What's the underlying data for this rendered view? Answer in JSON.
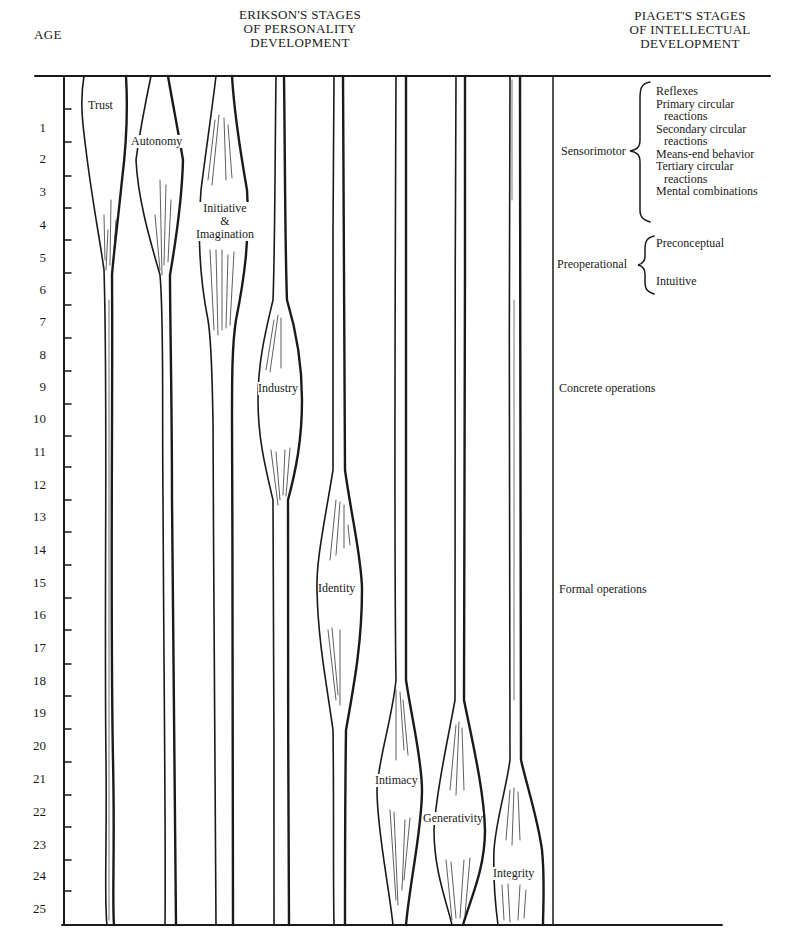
{
  "headers": {
    "age": "AGE",
    "erikson": [
      "ERIKSON'S STAGES",
      "OF PERSONALITY",
      "DEVELOPMENT"
    ],
    "piaget": [
      "PIAGET'S STAGES",
      "OF INTELLECTUAL",
      "DEVELOPMENT"
    ]
  },
  "age_axis": {
    "ticks": [
      "1",
      "2",
      "3",
      "4",
      "5",
      "6",
      "7",
      "8",
      "9",
      "10",
      "11",
      "12",
      "13",
      "14",
      "15",
      "16",
      "17",
      "18",
      "19",
      "20",
      "21",
      "22",
      "23",
      "24",
      "25"
    ],
    "min": 0,
    "max": 25
  },
  "erikson_stages": [
    {
      "label": "Trust",
      "peak_age_start": 0,
      "peak_age_end": 1.5
    },
    {
      "label": "Autonomy",
      "peak_age_start": 1,
      "peak_age_end": 3
    },
    {
      "label": "Initiative & Imagination",
      "line1": "Initiative",
      "line2": "&",
      "line3": "Imagination",
      "peak_age_start": 3,
      "peak_age_end": 5.5
    },
    {
      "label": "Industry",
      "peak_age_start": 7,
      "peak_age_end": 12
    },
    {
      "label": "Identity",
      "peak_age_start": 12,
      "peak_age_end": 18
    },
    {
      "label": "Intimacy",
      "peak_age_start": 18,
      "peak_age_end": 25
    },
    {
      "label": "Generativity",
      "peak_age_start": 19,
      "peak_age_end": 25
    },
    {
      "label": "Integrity",
      "peak_age_start": 21,
      "peak_age_end": 25
    }
  ],
  "piaget_stages": [
    {
      "label": "Sensorimotor",
      "substages": [
        "Reflexes",
        "Primary circular",
        "reactions",
        "Secondary circular",
        "reactions",
        "Means-end behavior",
        "Tertiary circular",
        "reactions",
        "Mental combinations"
      ]
    },
    {
      "label": "Preoperational",
      "substages": [
        "Preconceptual",
        "Intuitive"
      ]
    },
    {
      "label": "Concrete operations",
      "substages": []
    },
    {
      "label": "Formal operations",
      "substages": []
    }
  ]
}
